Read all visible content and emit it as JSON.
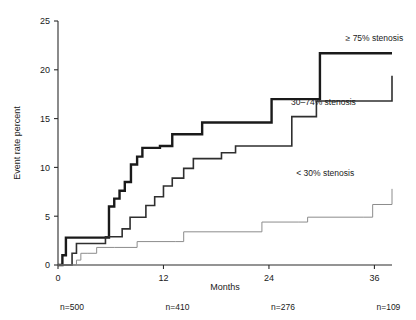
{
  "chart_data": {
    "type": "line",
    "title": "",
    "subtitle": "",
    "xlabel": "Months",
    "ylabel": "Event rate percent",
    "xlim": [
      0,
      38
    ],
    "ylim": [
      0,
      25
    ],
    "xticks": [
      0,
      12,
      24,
      36
    ],
    "xtick_labels": [
      "0",
      "12",
      "24",
      "36"
    ],
    "yticks": [
      0,
      5,
      10,
      15,
      20,
      25
    ],
    "ytick_labels": [
      "0",
      "5",
      "10",
      "15",
      "20",
      "25"
    ],
    "grid": false,
    "legend_position": "inline-right-annotations",
    "step_type": "post",
    "series": [
      {
        "name": "≥ 75% stenosis",
        "label": "≥ 75% stenosis",
        "color": "#1a1a1a",
        "line_width": 2.4,
        "label_x": 36.0,
        "label_y": 22.9,
        "x": [
          0.0,
          0.5,
          0.9,
          2.4,
          5.3,
          5.8,
          6.4,
          7.0,
          7.6,
          8.3,
          9.0,
          9.6,
          10.4,
          11.6,
          13.0,
          14.6,
          16.4,
          18.2,
          20.4,
          24.3,
          26.8,
          29.8,
          38.0
        ],
        "y": [
          0.0,
          1.0,
          2.8,
          2.8,
          2.8,
          6.0,
          6.8,
          7.6,
          8.5,
          10.3,
          11.1,
          12.0,
          12.0,
          12.2,
          13.4,
          13.4,
          14.6,
          14.6,
          14.6,
          17.0,
          17.0,
          21.7,
          21.7
        ]
      },
      {
        "name": "30–74% stenosis",
        "label": "30–74% stenosis",
        "color": "#2f2f2f",
        "line_width": 1.6,
        "label_x": 30.2,
        "label_y": 16.4,
        "x": [
          0.0,
          1.6,
          2.1,
          4.0,
          5.4,
          6.6,
          7.3,
          8.2,
          9.0,
          10.0,
          11.0,
          12.0,
          13.0,
          14.3,
          15.4,
          17.0,
          18.6,
          20.2,
          24.6,
          26.6,
          29.4,
          35.4,
          38.0
        ],
        "y": [
          0.0,
          1.2,
          2.2,
          2.2,
          2.9,
          2.9,
          3.7,
          4.9,
          4.9,
          6.1,
          7.0,
          8.1,
          8.9,
          9.9,
          10.9,
          10.9,
          11.5,
          12.2,
          12.2,
          15.2,
          16.8,
          16.8,
          19.4
        ]
      },
      {
        "name": "< 30% stenosis",
        "label": "< 30% stenosis",
        "color": "#8c8c8c",
        "line_width": 1.0,
        "label_x": 30.4,
        "label_y": 9.1,
        "x": [
          0.0,
          2.1,
          2.6,
          3.4,
          4.4,
          6.4,
          9.0,
          13.4,
          14.3,
          22.3,
          23.2,
          27.4,
          28.4,
          34.8,
          35.8,
          38.0
        ],
        "y": [
          0.0,
          0.5,
          1.2,
          1.2,
          1.8,
          1.8,
          2.4,
          2.4,
          3.4,
          3.4,
          4.4,
          4.4,
          4.9,
          4.9,
          6.2,
          7.8
        ]
      }
    ],
    "at_risk": {
      "prefix": "n=",
      "labels": [
        "n=500",
        "n=410",
        "n=276",
        "n=109"
      ],
      "values": [
        500,
        410,
        276,
        109
      ],
      "at_months": [
        0,
        12,
        24,
        36
      ]
    }
  },
  "colors": {
    "background": "#ffffff",
    "axis": "#2b2b2b",
    "text": "#1a1a1a",
    "series_high": "#1a1a1a",
    "series_mid": "#2f2f2f",
    "series_low": "#8c8c8c"
  }
}
